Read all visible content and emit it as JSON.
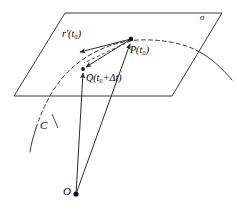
{
  "figure": {
    "width": 237,
    "height": 212,
    "background_color": "#ffffff",
    "line_color": "#3a3a3a",
    "text_color": "#000000"
  },
  "labels": {
    "plane": "σ",
    "tangent_vector": "r′(t₀)",
    "point_P": "P(t₀)",
    "point_Q": "Q(t₀+Δt)",
    "curve": "C",
    "origin": "O"
  },
  "geometry": {
    "plane": {
      "name": "tangent-plane-sigma",
      "vertices": [
        [
          65,
          13
        ],
        [
          222,
          13
        ],
        [
          172,
          96
        ],
        [
          14,
          96
        ]
      ],
      "stroke": "#3a3a3a",
      "stroke_width": 1,
      "fill": "none"
    },
    "curve_C": {
      "name": "space-curve-C",
      "dashed_segment": "M 36,128 C 44,104 56,82 72,68 C 92,50 118,41 138,40 C 160,39 182,43 196,50",
      "solid_segment": "M 196,50 C 210,57 222,68 232,80",
      "dash_pattern": "4 3"
    },
    "points": {
      "P": {
        "x": 131,
        "y": 39,
        "radius": 2.2
      },
      "Q": {
        "x": 83,
        "y": 69,
        "radius": 2.0
      },
      "O": {
        "x": 76,
        "y": 194,
        "radius": 2.6
      }
    },
    "vectors": [
      {
        "name": "tangent-vector-arrow",
        "from": [
          131,
          39
        ],
        "to": [
          78,
          52
        ],
        "style": "solid"
      },
      {
        "name": "secant-vector-PQ-arrow",
        "from": [
          131,
          39
        ],
        "to": [
          85,
          67
        ],
        "style": "solid"
      },
      {
        "name": "secant-chord-dashed",
        "from": [
          131,
          39
        ],
        "to": [
          83,
          63
        ],
        "style": "dashed"
      },
      {
        "name": "position-vector-OQ-arrow",
        "from": [
          76,
          194
        ],
        "to": [
          83,
          71
        ],
        "style": "solid"
      },
      {
        "name": "position-vector-OP-arrow",
        "from": [
          76,
          194
        ],
        "to": [
          130,
          42
        ],
        "style": "solid"
      }
    ]
  }
}
